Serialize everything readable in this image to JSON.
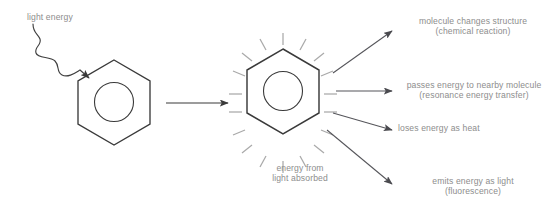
{
  "diagram": {
    "title_text": "light energy",
    "absorbed_caption": "energy from\nlight absorbed",
    "outcomes": [
      {
        "label": "molecule changes structure\n(chemical reaction)"
      },
      {
        "label": "passes energy to nearby molecule\n(resonance energy transfer)"
      },
      {
        "label": "loses energy as heat"
      },
      {
        "label": "emits energy as light\n(fluorescence)"
      }
    ]
  },
  "colors": {
    "text": "#8d8d8d",
    "stroke_dark": "#3a3a3a",
    "stroke_arrow": "#55555a",
    "ray": "#a9a9a9",
    "background": "#ffffff"
  }
}
